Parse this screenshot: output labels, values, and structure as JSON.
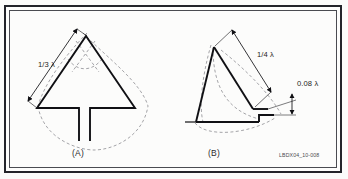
{
  "figure": {
    "id_code": "LBDX04_10-008",
    "background_color": "#fbfbfa",
    "line_color": "#101014",
    "dashed_color": "#8d8d92",
    "border_color": "#23242a"
  },
  "panels": [
    {
      "key": "a",
      "label": "(A)",
      "name": "bow-tie-antenna-with-stem",
      "dimensions": [
        {
          "key": "side_length",
          "label": "1/3 λ",
          "value": "1/3",
          "unit": "λ"
        }
      ]
    },
    {
      "key": "b",
      "label": "(B)",
      "name": "notched-triangular-antenna",
      "dimensions": [
        {
          "key": "side_length",
          "label": "1/4 λ",
          "value": "1/4",
          "unit": "λ"
        },
        {
          "key": "notch_gap",
          "label": "0.08 λ",
          "value": "0.08",
          "unit": "λ"
        }
      ]
    }
  ],
  "labels": {
    "panel_a": "(A)",
    "panel_b": "(B)",
    "dim_third_lambda": "1/3 λ",
    "dim_quarter_lambda": "1/4 λ",
    "dim_008_lambda": "0.08 λ",
    "figure_id": "LBDX04_10-008"
  }
}
